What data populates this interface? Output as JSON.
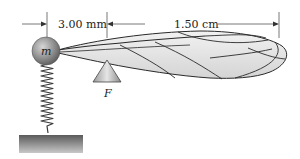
{
  "diagram": {
    "type": "physics-lever-wing",
    "labels": {
      "short_arm": "3.00 mm",
      "long_arm": "1.50 cm",
      "mass": "m",
      "fulcrum": "F"
    },
    "components": [
      "mass-ball",
      "spring",
      "ground-block",
      "fulcrum-triangle",
      "wing"
    ],
    "colors": {
      "wing_fill": "#e2e2e2",
      "wing_vein": "#2a2a2a",
      "ball": "#8e8e8e",
      "ground": "#6e6e6e",
      "dimension_line": "#555555"
    }
  }
}
